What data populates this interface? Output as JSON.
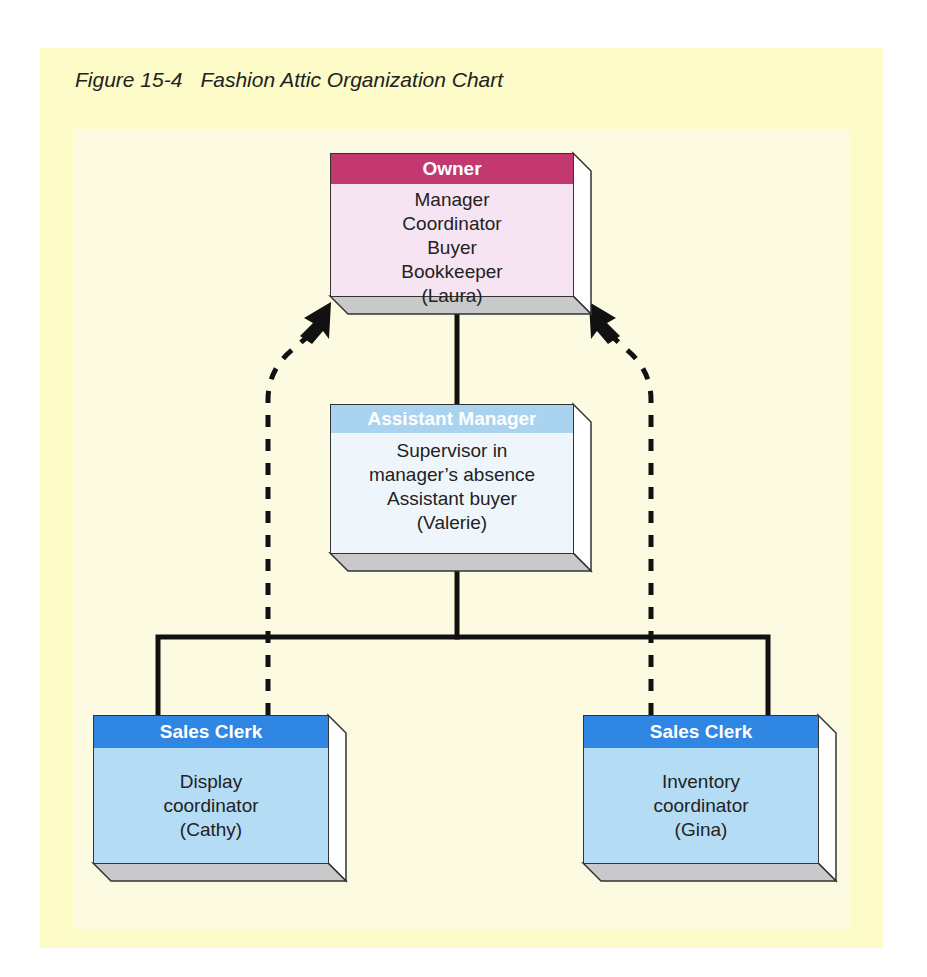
{
  "figure": {
    "number": "Figure 15-4",
    "title": "Fashion Attic Organization Chart"
  },
  "colors": {
    "panel_outer": "#fdfbc8",
    "panel_inner": "#fcfbe2",
    "owner_header": "#c2386f",
    "owner_body": "#f6e4f2",
    "assistant_header": "#a9d3ef",
    "assistant_body": "#eef6fb",
    "clerk_header": "#2f86e3",
    "clerk_body": "#b5dcf5",
    "depth_side": "#ffffff",
    "depth_bottom": "#c9c9cc",
    "line": "#111111"
  },
  "nodes": {
    "owner": {
      "title": "Owner",
      "lines": [
        "Manager",
        "Coordinator",
        "Buyer",
        "Bookkeeper",
        "(Laura)"
      ]
    },
    "assistant_manager": {
      "title": "Assistant Manager",
      "lines": [
        "Supervisor in",
        "manager’s absence",
        "Assistant buyer",
        "(Valerie)"
      ]
    },
    "sales_clerk_left": {
      "title": "Sales Clerk",
      "lines": [
        "Display",
        "coordinator",
        "(Cathy)"
      ]
    },
    "sales_clerk_right": {
      "title": "Sales Clerk",
      "lines": [
        "Inventory",
        "coordinator",
        "(Gina)"
      ]
    }
  },
  "edges": [
    {
      "from": "owner",
      "to": "assistant_manager",
      "style": "solid",
      "meaning": "reports-to"
    },
    {
      "from": "assistant_manager",
      "to": "sales_clerk_left",
      "style": "solid",
      "meaning": "reports-to"
    },
    {
      "from": "assistant_manager",
      "to": "sales_clerk_right",
      "style": "solid",
      "meaning": "reports-to"
    },
    {
      "from": "sales_clerk_left",
      "to": "owner",
      "style": "dashed-arrow",
      "meaning": "direct-line"
    },
    {
      "from": "sales_clerk_right",
      "to": "owner",
      "style": "dashed-arrow",
      "meaning": "direct-line"
    }
  ]
}
